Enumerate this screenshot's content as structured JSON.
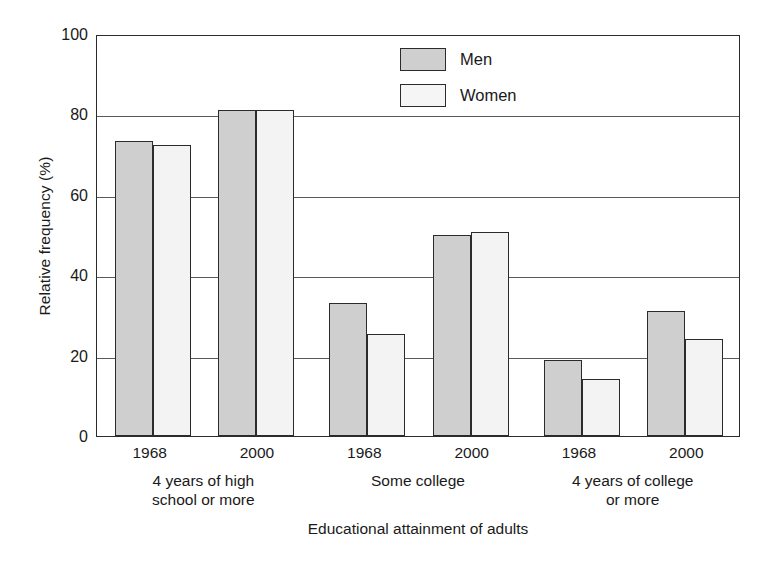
{
  "chart_data": {
    "type": "bar",
    "title": "",
    "xlabel": "Educational attainment of adults",
    "ylabel": "Relative frequency (%)",
    "ylim": [
      0,
      100
    ],
    "yticks": [
      0,
      20,
      40,
      60,
      80,
      100
    ],
    "grid": true,
    "legend_position": "top-center",
    "categories": [
      "4 years of high school or more - 1968",
      "4 years of high school or more - 2000",
      "Some college - 1968",
      "Some college - 2000",
      "4 years of college or more - 1968",
      "4 years of college or more - 2000"
    ],
    "groups": [
      {
        "group_label": "4 years of high\nschool or more",
        "group_label_line1": "4 years of high",
        "group_label_line2": "school or more",
        "years": [
          "1968",
          "2000"
        ]
      },
      {
        "group_label": "Some college",
        "group_label_line1": "Some college",
        "group_label_line2": "",
        "years": [
          "1968",
          "2000"
        ]
      },
      {
        "group_label": "4 years of college\nor more",
        "group_label_line1": "4 years of college",
        "group_label_line2": "or more",
        "years": [
          "1968",
          "2000"
        ]
      }
    ],
    "series": [
      {
        "name": "Men",
        "color": "#cfcfcf",
        "values": [
          73.5,
          81.0,
          33.0,
          50.0,
          19.0,
          31.0
        ]
      },
      {
        "name": "Women",
        "color": "#f3f3f3",
        "values": [
          72.5,
          81.2,
          25.5,
          50.8,
          14.2,
          24.2
        ]
      }
    ]
  },
  "axis": {
    "y_title": "Relative frequency (%)",
    "x_title": "Educational attainment of adults",
    "y_ticks": [
      "100",
      "80",
      "60",
      "40",
      "20",
      "0"
    ]
  },
  "legend": {
    "items": [
      {
        "label": "Men"
      },
      {
        "label": "Women"
      }
    ]
  },
  "x_labels": {
    "years": [
      "1968",
      "2000",
      "1968",
      "2000",
      "1968",
      "2000"
    ],
    "groups": [
      {
        "line1": "4 years of high",
        "line2": "school or more"
      },
      {
        "line1": "Some college",
        "line2": ""
      },
      {
        "line1": "4 years of college",
        "line2": "or more"
      }
    ]
  }
}
